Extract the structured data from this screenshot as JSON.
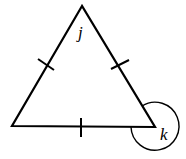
{
  "diagram": {
    "type": "equilateral-triangle",
    "vertices": {
      "top": {
        "x": 82,
        "y": 6
      },
      "bottom_left": {
        "x": 12,
        "y": 126
      },
      "bottom_right": {
        "x": 155,
        "y": 127
      }
    },
    "labels": {
      "j": "j",
      "k": "k"
    },
    "tick_marks": 3,
    "reflex_angle_vertex": "bottom_right",
    "stroke_color": "#000000",
    "background": "#ffffff"
  }
}
